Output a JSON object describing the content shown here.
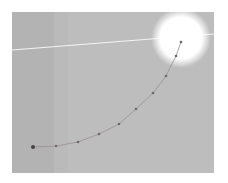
{
  "image": {
    "description": "Grayscale photo of sky with bright sun and a dotted sun-path trajectory curve",
    "background_color": "#bdbdbd",
    "sun": {
      "cx": 169,
      "cy": 26,
      "r": 24,
      "color": "#ffffff"
    },
    "horizon": {
      "x1": 0,
      "y1": 38,
      "x2": 202,
      "y2": 22,
      "color": "#f4f4f4"
    },
    "trajectory_points": [
      [
        21,
        135
      ],
      [
        44,
        134
      ],
      [
        66,
        130
      ],
      [
        87,
        122
      ],
      [
        107,
        112
      ],
      [
        124,
        97
      ],
      [
        141,
        81
      ],
      [
        154,
        64
      ],
      [
        164,
        44
      ],
      [
        169,
        30
      ]
    ],
    "point_color": "#6a6a6a",
    "curve_color": "#9a8f8f"
  }
}
